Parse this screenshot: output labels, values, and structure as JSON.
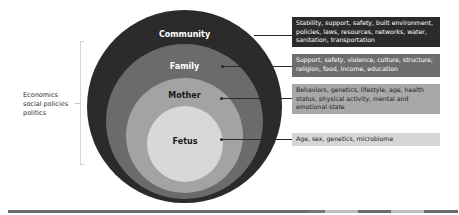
{
  "diagram": {
    "type": "nested-circles",
    "side_label": {
      "lines": [
        "Economics",
        "social policies",
        "politics"
      ]
    },
    "layers": [
      {
        "name": "Community",
        "color": "#2b2b2b",
        "label_color": "#ffffff",
        "box_color": "#2b2b2b",
        "box_text_color": "#ffffff",
        "description": "Stability, support, safety, built environment, policies, laws, resources, networks, water, sanitation, transportation"
      },
      {
        "name": "Family",
        "color": "#6b6b6b",
        "label_color": "#ffffff",
        "box_color": "#6e6e6e",
        "box_text_color": "#ffffff",
        "description": "Support, safety, violence, culture, structure, religion, food, income, education"
      },
      {
        "name": "Mother",
        "color": "#a3a3a3",
        "label_color": "#1a1a1a",
        "box_color": "#a8a8a8",
        "box_text_color": "#1a1a1a",
        "description": "Behaviors, genetics, lifestyle, age, health status, physical activity, mental and emotional state"
      },
      {
        "name": "Fetus",
        "color": "#d8d8d8",
        "label_color": "#1a1a1a",
        "box_color": "#d6d6d6",
        "box_text_color": "#1a1a1a",
        "description": "Age, sex, genetics, microbiome"
      }
    ]
  },
  "footer_bar": {
    "segments": [
      {
        "color": "#6a6a6a",
        "width": 300
      },
      {
        "color": "#767676",
        "width": 17
      },
      {
        "color": "#bdbdbd",
        "width": 33
      },
      {
        "color": "#6a6a6a",
        "width": 33
      },
      {
        "color": "#bdbdbd",
        "width": 33
      },
      {
        "color": "#6a6a6a",
        "width": 34
      }
    ]
  }
}
